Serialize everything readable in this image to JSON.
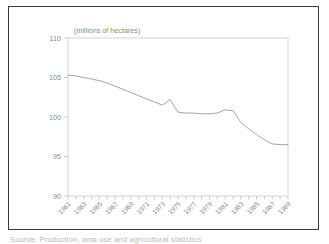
{
  "figure": {
    "caption_partial": "Source: Production, land use and agricultural statistics"
  },
  "chart_data": {
    "type": "line",
    "title": "(millions of hectares)",
    "xlabel": "",
    "ylabel": "",
    "ylim": [
      90,
      110
    ],
    "xlim": [
      1961,
      1989
    ],
    "yticks": [
      90,
      95,
      100,
      105,
      110
    ],
    "ytick_labels": [
      "90",
      "95",
      "100",
      "105",
      "110"
    ],
    "grid": false,
    "legend": "none",
    "xtick_labels": [
      "1961",
      "1963",
      "1965",
      "1967",
      "1969",
      "1971",
      "1973",
      "1975",
      "1977",
      "1979",
      "1981",
      "1983",
      "1985",
      "1987",
      "1989"
    ],
    "x": [
      1961,
      1962,
      1963,
      1964,
      1965,
      1966,
      1967,
      1968,
      1969,
      1970,
      1971,
      1972,
      1973,
      1974,
      1975,
      1976,
      1977,
      1978,
      1979,
      1980,
      1981,
      1982,
      1983,
      1984,
      1985,
      1986,
      1987,
      1988,
      1989
    ],
    "values": [
      105.3,
      105.2,
      105.0,
      104.8,
      104.6,
      104.3,
      103.9,
      103.5,
      103.1,
      102.7,
      102.3,
      101.9,
      101.5,
      102.2,
      100.6,
      100.5,
      100.5,
      100.4,
      100.4,
      100.5,
      100.9,
      100.8,
      99.3,
      98.5,
      97.8,
      97.1,
      96.6,
      96.5,
      96.5
    ],
    "colors": {
      "line": "#9a9a9a",
      "axis": "#c0c0c0",
      "text": "#8a8a8a",
      "frame": "#3a3a3a",
      "background": "#ffffff"
    }
  }
}
